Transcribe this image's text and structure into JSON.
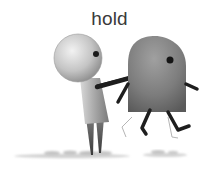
{
  "illustration": {
    "caption": "hold",
    "figures": [
      {
        "name": "round-head-figure",
        "role": "holder"
      },
      {
        "name": "dome-figure",
        "role": "held"
      }
    ],
    "colors": {
      "background": "#ffffff",
      "text": "#3a3a3a",
      "limb": "#1e1e1e",
      "shadow": "#cfcfcf"
    }
  }
}
